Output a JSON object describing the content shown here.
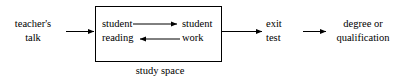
{
  "diagram": {
    "stroke_color": "#000000",
    "background_color": "#ffffff",
    "nodes": [
      {
        "id": "teachers_talk",
        "label": "teacher's\ntalk"
      },
      {
        "id": "student_reading",
        "label": "student\nreading"
      },
      {
        "id": "student_work",
        "label": "student\nwork"
      },
      {
        "id": "exit_test",
        "label": "exit\ntest"
      },
      {
        "id": "degree_or_qualification",
        "label": "degree or\nqualification"
      }
    ],
    "container": {
      "id": "study_space",
      "label": "study space"
    },
    "edges": [
      {
        "id": "e1",
        "from": "teachers_talk",
        "to": "study_space",
        "direction": "right"
      },
      {
        "id": "e2",
        "from": "student_reading",
        "to": "student_work",
        "direction": "right"
      },
      {
        "id": "e3",
        "from": "student_work",
        "to": "student_reading",
        "direction": "left"
      },
      {
        "id": "e4",
        "from": "study_space",
        "to": "exit_test",
        "direction": "right"
      },
      {
        "id": "e5",
        "from": "exit_test",
        "to": "degree_or_qualification",
        "direction": "right"
      }
    ]
  }
}
